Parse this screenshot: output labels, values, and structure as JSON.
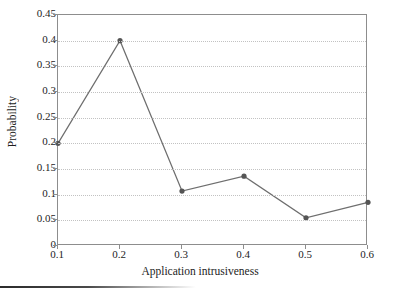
{
  "chart_data": {
    "type": "line",
    "title": "",
    "xlabel": "Application intrusiveness",
    "ylabel": "Probability",
    "x": [
      0.1,
      0.2,
      0.3,
      0.4,
      0.5,
      0.6
    ],
    "values": [
      0.2,
      0.4,
      0.107,
      0.136,
      0.055,
      0.085
    ],
    "series": [
      {
        "name": "Probability",
        "values": [
          0.2,
          0.4,
          0.107,
          0.136,
          0.055,
          0.085
        ]
      }
    ],
    "xlim": [
      0.1,
      0.6
    ],
    "ylim": [
      0,
      0.45
    ],
    "xticks": [
      "0.1",
      "0.2",
      "0.3",
      "0.4",
      "0.5",
      "0.6"
    ],
    "xtick_values": [
      0.1,
      0.2,
      0.3,
      0.4,
      0.5,
      0.6
    ],
    "yticks": [
      "0",
      "0.05",
      "0.1",
      "0.15",
      "0.2",
      "0.25",
      "0.3",
      "0.35",
      "0.4",
      "0.45"
    ],
    "ytick_values": [
      0,
      0.05,
      0.1,
      0.15,
      0.2,
      0.25,
      0.3,
      0.35,
      0.4,
      0.45
    ],
    "grid": "horizontal-dotted",
    "legend": "none",
    "marker": "filled-circle",
    "line_color": "#6e6e6e",
    "marker_color": "#555555",
    "grid_color": "#c2c2c2",
    "frame_color": "#8d8d8d",
    "background_color": "#ffffff"
  }
}
